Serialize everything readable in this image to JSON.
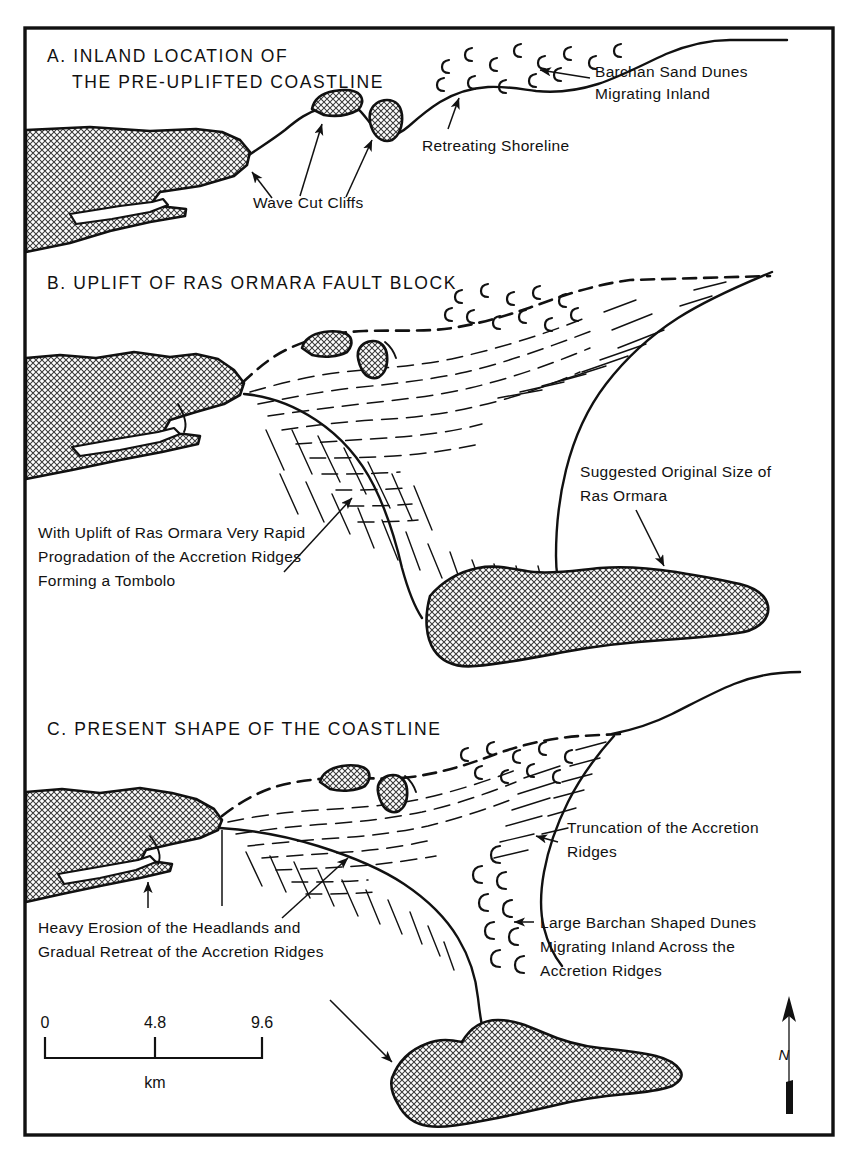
{
  "figure": {
    "domain": "diagram",
    "kind": "geomorphology-evolution-diagram",
    "background_color": "#ffffff",
    "ink_color": "#111111",
    "frame": {
      "x": 25,
      "y": 28,
      "width": 808,
      "height": 1107
    }
  },
  "panels": [
    {
      "id": "A",
      "title_line1": "A. INLAND LOCATION OF",
      "title_line2": "THE PRE-UPLIFTED COASTLINE",
      "annotations": [
        {
          "name": "wave-cut-cliffs",
          "text": "Wave Cut Cliffs"
        },
        {
          "name": "retreating-shoreline",
          "text": "Retreating Shoreline"
        },
        {
          "name": "barchan-sand-dunes",
          "line1": "Barchan Sand Dunes",
          "line2": "Migrating Inland"
        }
      ]
    },
    {
      "id": "B",
      "title_line1": "B. UPLIFT OF RAS ORMARA FAULT BLOCK",
      "title_line2": "",
      "annotations": [
        {
          "name": "uplift-progradation",
          "line1": "With Uplift of Ras Ormara Very Rapid",
          "line2": "Progradation of the Accretion Ridges",
          "line3": "Forming a Tombolo"
        },
        {
          "name": "suggested-original-size",
          "line1": "Suggested Original Size of",
          "line2": "Ras Ormara"
        }
      ]
    },
    {
      "id": "C",
      "title_line1": "C. PRESENT SHAPE OF THE COASTLINE",
      "title_line2": "",
      "annotations": [
        {
          "name": "truncation-accretion-ridges",
          "line1": "Truncation of the Accretion",
          "line2": "Ridges"
        },
        {
          "name": "large-barchan-dunes",
          "line1": "Large Barchan Shaped Dunes",
          "line2": "Migrating Inland Across the",
          "line3": "Accretion Ridges"
        },
        {
          "name": "heavy-erosion-headlands",
          "line1": "Heavy Erosion of the Headlands and",
          "line2": "Gradual Retreat of the Accretion Ridges"
        }
      ]
    }
  ],
  "scale_bar": {
    "unit_label": "km",
    "ticks": [
      "0",
      "4.8",
      "9.6"
    ],
    "values": [
      0,
      4.8,
      9.6
    ]
  },
  "north_arrow": {
    "label": "N"
  }
}
